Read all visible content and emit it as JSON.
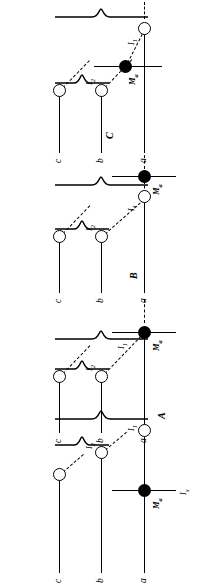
{
  "figure": {
    "type": "diagram",
    "orientation": "page rotated 90 degrees (landscape artwork on portrait canvas)",
    "row_labels": [
      "c",
      "b",
      "a"
    ],
    "node_labels": {
      "i2": "I",
      "i2_sub": "2",
      "i1": "I",
      "i1_sub": "1",
      "marker": "M",
      "marker_sub": "a",
      "ix": "I",
      "ix_sub": "x"
    },
    "panels": [
      {
        "id": "D",
        "label": "D",
        "marker_row": "between b and a",
        "marker_position": "mid-span",
        "i2_row": "b",
        "i1_row": "a",
        "i1_side": "right of marker",
        "has_ix_label": false
      },
      {
        "id": "C",
        "label": "C",
        "marker_row": "a",
        "marker_position": "right of I1",
        "i2_row": "b",
        "i1_row": "a",
        "i1_side": "left of marker",
        "has_ix_label": false
      },
      {
        "id": "B",
        "label": "B",
        "marker_row": "a",
        "marker_position": "coincident with I1 junction",
        "i2_row": "b",
        "i1_row": "a",
        "i1_side": "at marker",
        "has_ix_label": false
      },
      {
        "id": "A",
        "label": "A",
        "marker_row": "a",
        "marker_position": "left of I1",
        "i2_row": "b",
        "i1_row": "a",
        "i1_side": "right of marker",
        "has_ix_label": true
      }
    ]
  }
}
